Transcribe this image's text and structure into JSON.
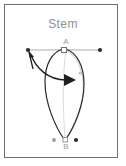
{
  "figure": {
    "title": "Stem",
    "title_color": "#8d8e90",
    "frame_color": "#6f7072",
    "background": "#ffffff",
    "curve_color": "#2b2b2b",
    "ghost_color": "#c9cacc",
    "line_color": "#a8a9ab",
    "marker_fill": "#ffffff",
    "dot_color": "#2b2b2b",
    "labels": {
      "point_a": "A",
      "point_b": "B"
    },
    "markers": [
      {
        "name": "left-endpoint-dot",
        "x": 28,
        "y": 50,
        "shape": "filled-circle"
      },
      {
        "name": "right-endpoint-dot",
        "x": 100,
        "y": 50,
        "shape": "filled-circle"
      },
      {
        "name": "point-a-square",
        "x": 64,
        "y": 50,
        "shape": "open-square"
      },
      {
        "name": "bottom-left-dot",
        "x": 54,
        "y": 140,
        "shape": "filled-circle"
      },
      {
        "name": "bottom-right-dot",
        "x": 76,
        "y": 140,
        "shape": "filled-circle"
      },
      {
        "name": "point-b-square",
        "x": 65,
        "y": 140,
        "shape": "open-square"
      },
      {
        "name": "ghost-midpoint-dot",
        "x": 80,
        "y": 73,
        "shape": "grey-circle"
      }
    ],
    "arrows": [
      {
        "name": "upper-left-arrow",
        "direction": "up-left",
        "tip_x": 29,
        "tip_y": 51
      },
      {
        "name": "curved-sweep-arrow",
        "direction": "right",
        "tip_x": 72,
        "tip_y": 80
      }
    ],
    "elements": {
      "horizontal_axis": "line from left dot through A to right dot",
      "stem_loop": "teardrop loop from A down to B",
      "ghost_loop": "offset light-grey teardrop loop"
    }
  }
}
